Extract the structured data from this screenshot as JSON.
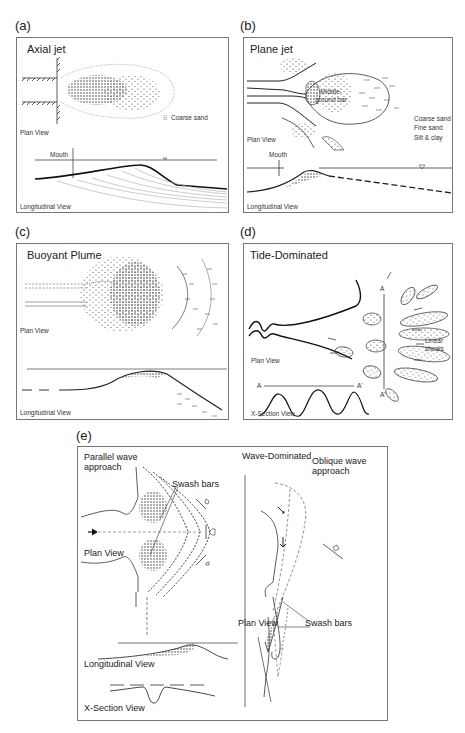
{
  "figure": {
    "panels": [
      {
        "id": "a",
        "label": "(a)",
        "title": "Axial jet",
        "plan_view_label": "Plan View",
        "longitudinal_view_label": "Longitudinal View",
        "mouth_label": "Mouth",
        "legend": [
          {
            "symbol": "dots",
            "text": "Coarse sand"
          }
        ]
      },
      {
        "id": "b",
        "label": "(b)",
        "title": "Plane jet",
        "plan_view_label": "Plan View",
        "longitudinal_view_label": "Longitudinal View",
        "mouth_label": "Mouth",
        "bar_label": "Middle-ground bar",
        "legend": [
          {
            "symbol": "dots",
            "text": "Coarse sand"
          },
          {
            "symbol": "fine-dashes",
            "text": "Fine sand"
          },
          {
            "symbol": "dashes",
            "text": "Silt & clay"
          }
        ]
      },
      {
        "id": "c",
        "label": "(c)",
        "title": "Buoyant Plume",
        "plan_view_label": "Plan View",
        "longitudinal_view_label": "Longitudinal View"
      },
      {
        "id": "d",
        "label": "(d)",
        "title": "Tide-Dominated",
        "plan_view_label": "Plan View",
        "xsection_view_label": "X-Section View",
        "shoals_label_line1": "Linear",
        "shoals_label_line2": "shoals",
        "section_a": "A",
        "section_a_prime": "A'"
      },
      {
        "id": "e",
        "label": "(e)",
        "title": "Wave-Dominated",
        "left_heading_line1": "Parallel wave",
        "left_heading_line2": "approach",
        "right_heading_line1": "Oblique wave",
        "right_heading_line2": "approach",
        "swash_bars_left": "Swash bars",
        "swash_bars_right": "Swash bars",
        "plan_view_left": "Plan View",
        "plan_view_right": "Plan View",
        "longitudinal_view_label": "Longitudinal View",
        "xsection_view_label": "X-Section View"
      }
    ]
  }
}
